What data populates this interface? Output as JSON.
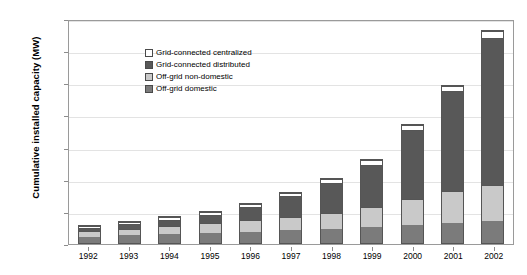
{
  "chart_data": {
    "type": "bar",
    "subtype": "stacked-vertical-bar",
    "title": "",
    "xlabel": "",
    "ylabel": "Cumulative installed capacity (MW)",
    "ylim": [
      0,
      1400
    ],
    "yticks": [
      0,
      200,
      400,
      600,
      800,
      1000,
      1200,
      1400
    ],
    "ytick_labels": [
      "0",
      "200",
      "400",
      "600",
      "800",
      "1000",
      "1200",
      "1400"
    ],
    "grid": true,
    "grid_axis": "y",
    "legend_position": "top-left-inside",
    "categories": [
      "1992",
      "1993",
      "1994",
      "1995",
      "1996",
      "1997",
      "1998",
      "1999",
      "2000",
      "2001",
      "2002"
    ],
    "stack_order_bottom_to_top": [
      "Off-grid domestic",
      "Off-grid non-domestic",
      "Grid-connected distributed",
      "Grid-connected centralized"
    ],
    "series": [
      {
        "name": "Off-grid domestic",
        "color": "#7b7b7b",
        "values": [
          40,
          48,
          55,
          62,
          70,
          78,
          88,
          98,
          110,
          122,
          135
        ]
      },
      {
        "name": "Off-grid non-domestic",
        "color": "#c9c9c9",
        "values": [
          35,
          42,
          52,
          60,
          72,
          85,
          100,
          125,
          165,
          200,
          225
        ]
      },
      {
        "name": "Grid-connected distributed",
        "color": "#585858",
        "values": [
          18,
          27,
          38,
          53,
          80,
          130,
          185,
          265,
          430,
          625,
          915
        ]
      },
      {
        "name": "Grid-connected centralized",
        "color": "#ffffff",
        "values": [
          10,
          12,
          14,
          16,
          18,
          20,
          24,
          26,
          28,
          30,
          45
        ]
      }
    ],
    "totals": [
      103,
      129,
      159,
      191,
      240,
      313,
      397,
      514,
      733,
      977,
      1320
    ],
    "legend_entries": [
      "Grid-connected centralized",
      "Grid-connected distributed",
      "Off-grid non-domestic",
      "Off-grid domestic"
    ],
    "legend_colors": [
      "#ffffff",
      "#585858",
      "#c9c9c9",
      "#7b7b7b"
    ]
  }
}
